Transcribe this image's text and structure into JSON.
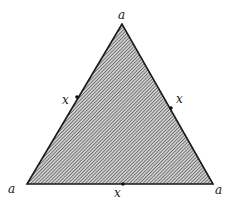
{
  "diagram": {
    "type": "equilateral-triangle",
    "fill_pattern": "diagonal-hatch",
    "colors": {
      "edge": "#1a1a1a",
      "hatch": "#444444",
      "background": "#ffffff"
    },
    "vertices": [
      {
        "id": "top",
        "label": "a"
      },
      {
        "id": "bottom-left",
        "label": "a"
      },
      {
        "id": "bottom-right",
        "label": "a"
      }
    ],
    "edge_midpoints": [
      {
        "id": "left-edge",
        "label": "x"
      },
      {
        "id": "right-edge",
        "label": "x"
      },
      {
        "id": "bottom-edge",
        "label": "x"
      }
    ]
  }
}
